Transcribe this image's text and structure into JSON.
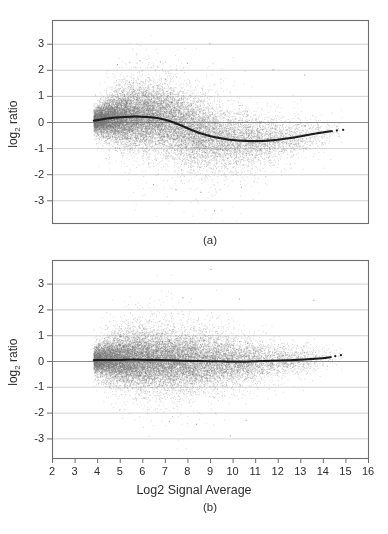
{
  "figure": {
    "background": "#ffffff",
    "xlabel": "Log2 Signal Average",
    "ylabel_pre": "log",
    "ylabel_sub": "2",
    "ylabel_post": " ratio",
    "caption_a": "(a)",
    "caption_b": "(b)",
    "colors": {
      "scatter": "#6e6e6e",
      "trend": "#1c1c1c",
      "grid": "#d2d2d2",
      "zero_line": "#8c8c8c",
      "frame": "#6e6e6e",
      "text": "#2e2e2e"
    }
  },
  "chart_data": [
    {
      "id": "a",
      "type": "scatter",
      "title": "(a)",
      "ylabel": "log2 ratio",
      "xlabel": "",
      "xlim": [
        2,
        16
      ],
      "ylim": [
        -3.9,
        3.9
      ],
      "x_ticks": [
        2,
        3,
        4,
        5,
        6,
        7,
        8,
        9,
        10,
        11,
        12,
        13,
        14,
        15,
        16
      ],
      "x_ticks_visible": false,
      "y_ticks": [
        3,
        2,
        1,
        0,
        -1,
        -2,
        -3
      ],
      "grid": "horizontal",
      "zero_line": true,
      "legend": "none",
      "trend_line": [
        [
          3.85,
          0.05
        ],
        [
          4.0,
          0.07
        ],
        [
          4.2,
          0.1
        ],
        [
          4.4,
          0.13
        ],
        [
          4.6,
          0.15
        ],
        [
          4.8,
          0.17
        ],
        [
          5.0,
          0.18
        ],
        [
          5.2,
          0.19
        ],
        [
          5.4,
          0.2
        ],
        [
          5.6,
          0.21
        ],
        [
          5.8,
          0.21
        ],
        [
          6.0,
          0.2
        ],
        [
          6.2,
          0.19
        ],
        [
          6.4,
          0.18
        ],
        [
          6.6,
          0.16
        ],
        [
          6.8,
          0.13
        ],
        [
          7.0,
          0.09
        ],
        [
          7.2,
          0.04
        ],
        [
          7.4,
          -0.02
        ],
        [
          7.6,
          -0.09
        ],
        [
          7.8,
          -0.16
        ],
        [
          8.0,
          -0.24
        ],
        [
          8.2,
          -0.31
        ],
        [
          8.4,
          -0.38
        ],
        [
          8.6,
          -0.44
        ],
        [
          8.8,
          -0.49
        ],
        [
          9.0,
          -0.54
        ],
        [
          9.2,
          -0.58
        ],
        [
          9.4,
          -0.61
        ],
        [
          9.6,
          -0.64
        ],
        [
          9.8,
          -0.67
        ],
        [
          10.0,
          -0.69
        ],
        [
          10.25,
          -0.71
        ],
        [
          10.5,
          -0.72
        ],
        [
          10.75,
          -0.73
        ],
        [
          11.0,
          -0.73
        ],
        [
          11.25,
          -0.73
        ],
        [
          11.5,
          -0.72
        ],
        [
          11.75,
          -0.7
        ],
        [
          12.0,
          -0.68
        ],
        [
          12.25,
          -0.65
        ],
        [
          12.5,
          -0.62
        ],
        [
          12.75,
          -0.59
        ],
        [
          13.0,
          -0.55
        ],
        [
          13.25,
          -0.51
        ],
        [
          13.5,
          -0.47
        ],
        [
          13.75,
          -0.43
        ],
        [
          14.0,
          -0.4
        ],
        [
          14.2,
          -0.37
        ],
        [
          14.4,
          -0.35
        ]
      ],
      "trend_detached_points": [
        [
          14.62,
          -0.32
        ],
        [
          14.9,
          -0.3
        ]
      ],
      "scatter": {
        "n": 20000,
        "x_start": 3.85,
        "bin_width": 0.5,
        "bin_weights": [
          14,
          13,
          12,
          11,
          10,
          9,
          8,
          7.5,
          6.5,
          6,
          5,
          4.5,
          3.8,
          3.2,
          2.6,
          2.2,
          1.8,
          1.4,
          1.0,
          0.7,
          0.4,
          0.2
        ],
        "sd_profile": [
          [
            3.9,
            0.2
          ],
          [
            4.5,
            0.35
          ],
          [
            5.0,
            0.45
          ],
          [
            5.5,
            0.52
          ],
          [
            6.0,
            0.57
          ],
          [
            6.5,
            0.6
          ],
          [
            7.0,
            0.62
          ],
          [
            7.5,
            0.63
          ],
          [
            8.0,
            0.63
          ],
          [
            8.5,
            0.62
          ],
          [
            9.0,
            0.6
          ],
          [
            9.5,
            0.57
          ],
          [
            10.0,
            0.53
          ],
          [
            10.5,
            0.5
          ],
          [
            11.0,
            0.46
          ],
          [
            11.5,
            0.42
          ],
          [
            12.0,
            0.38
          ],
          [
            12.5,
            0.35
          ],
          [
            13.0,
            0.31
          ],
          [
            13.5,
            0.28
          ],
          [
            14.0,
            0.25
          ],
          [
            14.9,
            0.2
          ]
        ],
        "seed": 1337
      },
      "outliers": [
        [
          9.0,
          3.0
        ],
        [
          5.9,
          2.35
        ],
        [
          6.8,
          2.3
        ],
        [
          4.9,
          2.2
        ],
        [
          8.0,
          2.25
        ],
        [
          11.8,
          2.0
        ],
        [
          13.2,
          1.8
        ],
        [
          9.2,
          -3.4
        ],
        [
          8.6,
          -2.7
        ],
        [
          7.5,
          -2.6
        ],
        [
          10.4,
          -2.5
        ],
        [
          6.5,
          -2.4
        ]
      ]
    },
    {
      "id": "b",
      "type": "scatter",
      "title": "(b)",
      "ylabel": "log2 ratio",
      "xlabel": "Log2 Signal Average",
      "xlim": [
        2,
        16
      ],
      "ylim": [
        -3.9,
        3.9
      ],
      "x_ticks": [
        2,
        3,
        4,
        5,
        6,
        7,
        8,
        9,
        10,
        11,
        12,
        13,
        14,
        15,
        16
      ],
      "x_ticks_visible": true,
      "y_ticks": [
        3,
        2,
        1,
        0,
        -1,
        -2,
        -3
      ],
      "grid": "horizontal",
      "zero_line": true,
      "legend": "none",
      "trend_line": [
        [
          3.85,
          0.03
        ],
        [
          4.2,
          0.04
        ],
        [
          4.6,
          0.04
        ],
        [
          5.0,
          0.04
        ],
        [
          5.4,
          0.05
        ],
        [
          5.8,
          0.05
        ],
        [
          6.2,
          0.04
        ],
        [
          6.6,
          0.04
        ],
        [
          7.0,
          0.03
        ],
        [
          7.4,
          0.02
        ],
        [
          7.8,
          0.01
        ],
        [
          8.2,
          0.0
        ],
        [
          8.6,
          0.0
        ],
        [
          9.0,
          -0.01
        ],
        [
          9.4,
          -0.01
        ],
        [
          9.8,
          -0.02
        ],
        [
          10.2,
          -0.02
        ],
        [
          10.6,
          -0.02
        ],
        [
          11.0,
          -0.01
        ],
        [
          11.4,
          0.0
        ],
        [
          11.8,
          0.01
        ],
        [
          12.2,
          0.02
        ],
        [
          12.6,
          0.03
        ],
        [
          13.0,
          0.05
        ],
        [
          13.4,
          0.07
        ],
        [
          13.7,
          0.09
        ],
        [
          14.0,
          0.11
        ],
        [
          14.2,
          0.13
        ],
        [
          14.35,
          0.15
        ]
      ],
      "trend_detached_points": [
        [
          14.55,
          0.19
        ],
        [
          14.8,
          0.23
        ]
      ],
      "scatter": {
        "n": 20000,
        "x_start": 3.85,
        "bin_width": 0.5,
        "bin_weights": [
          13,
          13,
          12.5,
          12,
          11,
          10,
          9.5,
          9,
          8,
          7,
          6,
          5.2,
          4.4,
          3.6,
          2.9,
          2.3,
          1.8,
          1.4,
          1.0,
          0.7,
          0.4,
          0.2
        ],
        "sd_profile": [
          [
            3.9,
            0.22
          ],
          [
            4.5,
            0.36
          ],
          [
            5.0,
            0.44
          ],
          [
            5.5,
            0.48
          ],
          [
            6.0,
            0.5
          ],
          [
            6.5,
            0.52
          ],
          [
            7.0,
            0.53
          ],
          [
            7.5,
            0.53
          ],
          [
            8.0,
            0.52
          ],
          [
            8.5,
            0.5
          ],
          [
            9.0,
            0.48
          ],
          [
            9.5,
            0.46
          ],
          [
            10.0,
            0.43
          ],
          [
            10.5,
            0.4
          ],
          [
            11.0,
            0.37
          ],
          [
            11.5,
            0.34
          ],
          [
            12.0,
            0.31
          ],
          [
            12.5,
            0.28
          ],
          [
            13.0,
            0.26
          ],
          [
            13.5,
            0.23
          ],
          [
            14.0,
            0.21
          ],
          [
            14.9,
            0.18
          ]
        ],
        "seed": 7331
      },
      "outliers": [
        [
          9.05,
          3.55
        ],
        [
          7.8,
          2.45
        ],
        [
          10.3,
          2.4
        ],
        [
          13.6,
          2.35
        ],
        [
          8.4,
          -2.45
        ],
        [
          10.6,
          -2.3
        ],
        [
          7.2,
          -2.35
        ],
        [
          9.9,
          -2.9
        ]
      ]
    }
  ]
}
